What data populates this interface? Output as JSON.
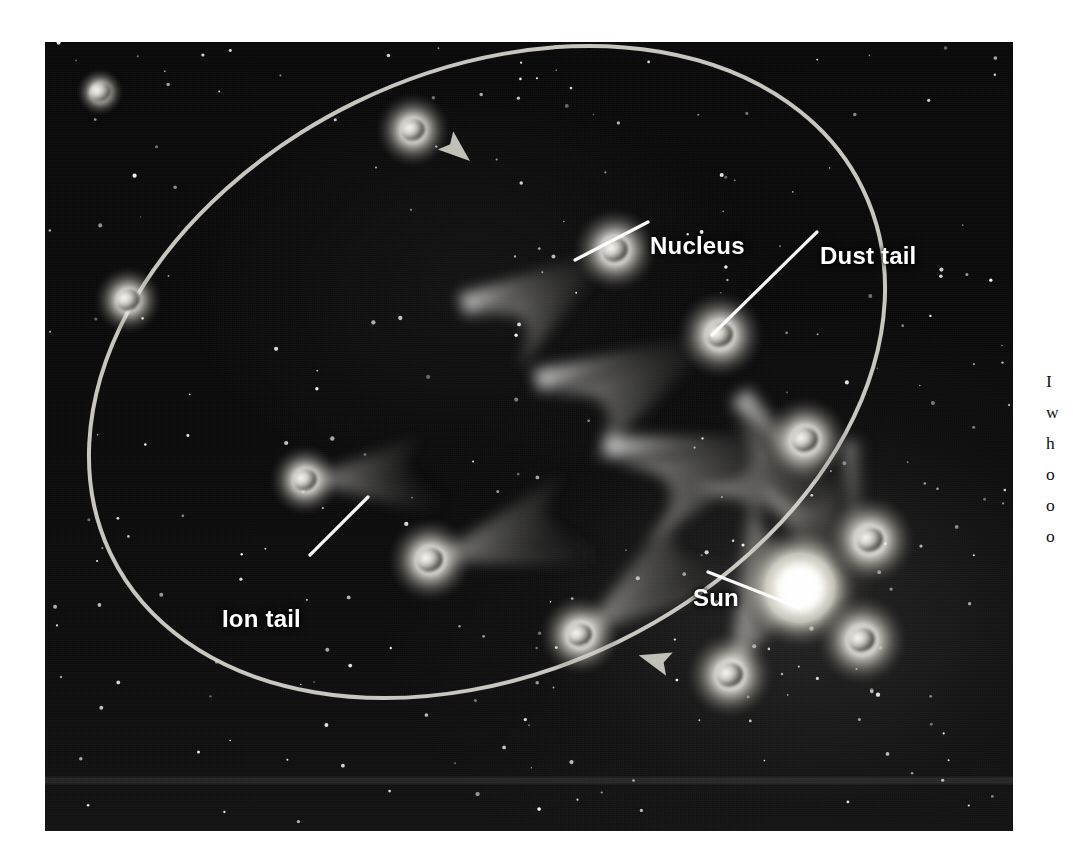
{
  "figure": {
    "title": "Comet orbit around the Sun",
    "background_color": "#050506",
    "plate": {
      "x": 45,
      "y": 42,
      "width": 968,
      "height": 789
    }
  },
  "labels": [
    {
      "id": "nucleus",
      "text": "Nucleus",
      "x": 605,
      "y": 190,
      "leader": {
        "x1": 648,
        "y1": 222,
        "x2": 575,
        "y2": 260
      }
    },
    {
      "id": "dust_tail",
      "text": "Dust tail",
      "x": 775,
      "y": 200,
      "leader": {
        "x1": 817,
        "y1": 232,
        "x2": 712,
        "y2": 335
      }
    },
    {
      "id": "ion_tail",
      "text": "Ion tail",
      "x": 177,
      "y": 563,
      "leader": {
        "x1": 310,
        "y1": 555,
        "x2": 368,
        "y2": 497
      }
    },
    {
      "id": "sun",
      "text": "Sun",
      "x": 648,
      "y": 542,
      "leader": {
        "x1": 708,
        "y1": 572,
        "x2": 800,
        "y2": 608
      }
    }
  ],
  "sun": {
    "label": "Sun",
    "center_x": 800,
    "center_y": 588,
    "radius": 46,
    "core_color": "#ffffff",
    "glow_color": "#f2f0ea"
  },
  "orbit": {
    "name": "comet-orbit-ellipse",
    "stroke_color": "#d8d6ce",
    "stroke_width": 4,
    "center_x": 487,
    "center_y": 372,
    "radius_x": 418,
    "radius_y": 300,
    "rotation_deg": -26,
    "direction_arrows": [
      {
        "x": 457,
        "y": 150,
        "angle_deg": 40,
        "points": "right-down"
      },
      {
        "x": 655,
        "y": 660,
        "angle_deg": 196,
        "points": "left"
      }
    ]
  },
  "comets": [
    {
      "id": "c1",
      "x": 100,
      "y": 92,
      "nucleus_r": 11,
      "coma_r": 14,
      "tail": "none",
      "stage": "aphelion"
    },
    {
      "id": "c2",
      "x": 128,
      "y": 300,
      "nucleus_r": 12,
      "coma_r": 20,
      "tail": "none",
      "stage": "inbound-far"
    },
    {
      "id": "c3",
      "x": 413,
      "y": 130,
      "nucleus_r": 12,
      "coma_r": 22,
      "tail": "none",
      "stage": "outbound-far"
    },
    {
      "id": "c4",
      "x": 615,
      "y": 250,
      "nucleus_r": 13,
      "coma_r": 25,
      "tail": "dust-and-ion",
      "tail_angle_deg": 218,
      "tail_length": 150,
      "stage": "outbound"
    },
    {
      "id": "c5",
      "x": 720,
      "y": 335,
      "nucleus_r": 13,
      "coma_r": 26,
      "tail": "dust-and-ion",
      "tail_angle_deg": 212,
      "tail_length": 175,
      "stage": "outbound"
    },
    {
      "id": "c6",
      "x": 805,
      "y": 440,
      "nucleus_r": 13,
      "coma_r": 26,
      "tail": "dust-and-ion",
      "tail_angle_deg": 200,
      "tail_length": 185,
      "stage": "outbound-near"
    },
    {
      "id": "c7",
      "x": 870,
      "y": 540,
      "nucleus_r": 13,
      "coma_r": 27,
      "tail": "dust-and-ion",
      "tail_angle_deg": 150,
      "tail_length": 180,
      "stage": "near-perihelion"
    },
    {
      "id": "c8",
      "x": 862,
      "y": 640,
      "nucleus_r": 13,
      "coma_r": 27,
      "tail": "dust-and-ion",
      "tail_angle_deg": 110,
      "tail_length": 185,
      "stage": "perihelion"
    },
    {
      "id": "c9",
      "x": 730,
      "y": 675,
      "nucleus_r": 13,
      "coma_r": 26,
      "tail": "dust-and-ion",
      "tail_angle_deg": 70,
      "tail_length": 180,
      "stage": "inbound-near"
    },
    {
      "id": "c10",
      "x": 580,
      "y": 635,
      "nucleus_r": 12,
      "coma_r": 24,
      "tail": "dust-and-ion",
      "tail_angle_deg": 40,
      "tail_length": 165,
      "stage": "inbound"
    },
    {
      "id": "c11",
      "x": 430,
      "y": 560,
      "nucleus_r": 13,
      "coma_r": 25,
      "tail": "dust-and-ion",
      "tail_angle_deg": 20,
      "tail_length": 160,
      "stage": "inbound"
    },
    {
      "id": "c12",
      "x": 305,
      "y": 480,
      "nucleus_r": 12,
      "coma_r": 21,
      "tail": "dust-and-ion",
      "tail_angle_deg": 8,
      "tail_length": 130,
      "stage": "inbound-mid"
    }
  ],
  "side_text": {
    "visible_fragment": true,
    "lines": [
      "I",
      "w",
      "h",
      "o",
      "o",
      "o"
    ]
  },
  "stars": {
    "count": 230,
    "color": "#ffffff"
  }
}
